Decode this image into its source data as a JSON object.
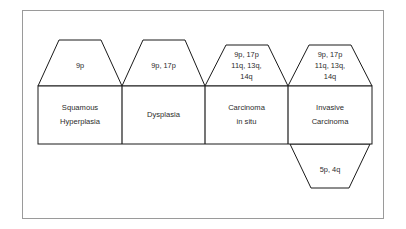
{
  "figure": {
    "type": "progression-diagram",
    "background_color": "#ffffff",
    "line_color": "#1a1a1a",
    "frame_color": "#9a9a9a",
    "text_color": "#2b2b2b"
  },
  "stages": [
    {
      "id": "squamous-hyperplasia",
      "name_line1": "Squamous",
      "name_line2": "Hyperplasia",
      "alterations_line1": "9p",
      "alterations_line2": "",
      "alterations_line3": ""
    },
    {
      "id": "dysplasia",
      "name_line1": "Dysplasia",
      "name_line2": "",
      "alterations_line1": "9p, 17p",
      "alterations_line2": "",
      "alterations_line3": ""
    },
    {
      "id": "carcinoma-in-situ",
      "name_line1": "Carcinoma",
      "name_line2": "in situ",
      "alterations_line1": "9p, 17p",
      "alterations_line2": "11q, 13q,",
      "alterations_line3": "14q"
    },
    {
      "id": "invasive-carcinoma",
      "name_line1": "Invasive",
      "name_line2": "Carcinoma",
      "alterations_line1": "9p, 17p",
      "alterations_line2": "11q, 13q,",
      "alterations_line3": "14q"
    }
  ],
  "lower_callout": {
    "id": "invasive-carcinoma-additional",
    "label": "5p, 4q"
  }
}
